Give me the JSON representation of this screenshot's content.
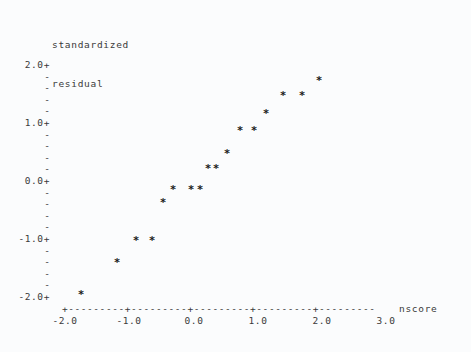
{
  "chart_data": {
    "type": "scatter",
    "title": "standardized residual",
    "title_lines": [
      "standardized",
      "residual"
    ],
    "xlabel": "nscore",
    "ylabel": "standardized residual",
    "xlim": [
      -2.5,
      3.5
    ],
    "ylim": [
      -2.0,
      2.0
    ],
    "xticks": [
      -2.0,
      -1.0,
      0.0,
      1.0,
      2.0,
      3.0
    ],
    "xticklabels": [
      "-2.0",
      "-1.0",
      "0.0",
      "1.0",
      "2.0",
      "3.0"
    ],
    "yticks": [
      2.0,
      1.0,
      0.0,
      -1.0,
      -2.0
    ],
    "yticklabels": [
      "2.0+",
      "1.0+",
      "0.0+",
      "-1.0+",
      "-2.0+"
    ],
    "yminor_per_interval": 4,
    "yminor_glyph": "-",
    "ytick_glyph": "+",
    "xaxis_line": "+---------+---------+---------+---------+---------",
    "point_marker": "*",
    "grid": false,
    "legend": null,
    "n_points": 20,
    "points": [
      {
        "x": -1.9,
        "y": -1.96
      },
      {
        "x": -1.4,
        "y": -1.28
      },
      {
        "x": -1.03,
        "y": -0.97
      },
      {
        "x": -0.86,
        "y": -0.97
      },
      {
        "x": -0.72,
        "y": -0.37
      },
      {
        "x": -0.56,
        "y": -0.12
      },
      {
        "x": -0.36,
        "y": -0.12
      },
      {
        "x": -0.26,
        "y": -0.12
      },
      {
        "x": -0.11,
        "y": 0.25
      },
      {
        "x": -0.02,
        "y": 0.25
      },
      {
        "x": 0.13,
        "y": 0.43
      },
      {
        "x": 0.33,
        "y": 0.77
      },
      {
        "x": 0.5,
        "y": 0.77
      },
      {
        "x": 0.69,
        "y": 1.02
      },
      {
        "x": 0.9,
        "y": 1.22
      },
      {
        "x": 1.22,
        "y": 1.48
      },
      {
        "x": 1.63,
        "y": 1.73
      }
    ],
    "pixel_points": [
      {
        "px": 81,
        "py": 294
      },
      {
        "px": 117,
        "py": 262
      },
      {
        "px": 136,
        "py": 240
      },
      {
        "px": 152,
        "py": 240
      },
      {
        "px": 163,
        "py": 202
      },
      {
        "px": 173,
        "py": 189
      },
      {
        "px": 191,
        "py": 189
      },
      {
        "px": 200,
        "py": 189
      },
      {
        "px": 208,
        "py": 168
      },
      {
        "px": 216,
        "py": 168
      },
      {
        "px": 227,
        "py": 153
      },
      {
        "px": 240,
        "py": 130
      },
      {
        "px": 254,
        "py": 130
      },
      {
        "px": 266,
        "py": 113
      },
      {
        "px": 283,
        "py": 95
      },
      {
        "px": 302,
        "py": 95
      },
      {
        "px": 319,
        "py": 80
      }
    ]
  },
  "axes": {
    "y_major": [
      {
        "label": "2.0+",
        "px_top": 59
      },
      {
        "label": "1.0+",
        "px_top": 117
      },
      {
        "label": "0.0+",
        "px_top": 175
      },
      {
        "label": "-1.0+",
        "px_top": 233
      },
      {
        "label": "-2.0+",
        "px_top": 291
      }
    ],
    "y_minor_rows": [
      71,
      82,
      94,
      105,
      129,
      140,
      152,
      163,
      187,
      198,
      210,
      221,
      245,
      256,
      268,
      279
    ],
    "x_tick_px": [
      65,
      129,
      194,
      258,
      322,
      386
    ],
    "x_name_px": 399
  },
  "colors": {
    "background": "#fbfcfd",
    "text": "#3a3a3a",
    "marker": "#1c1c1c"
  }
}
